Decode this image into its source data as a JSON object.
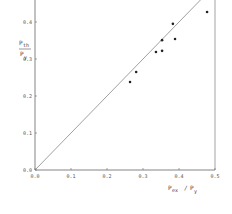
{
  "chart_data": {
    "type": "scatter",
    "title": "",
    "xlabel": "P_ex / P_y",
    "ylabel": "P_th / P_y",
    "xlim": [
      0.0,
      0.5
    ],
    "ylim": [
      0.0,
      0.46
    ],
    "x_ticks": [
      "0.0",
      "0.1",
      "0.2",
      "0.3",
      "0.4",
      "0.5"
    ],
    "y_ticks": [
      "0.0",
      "0.1",
      "0.2",
      "0.3",
      "0.4"
    ],
    "grid": false,
    "legend": null,
    "series": [
      {
        "name": "data",
        "marker": "dot",
        "points": [
          {
            "x": 0.264,
            "y": 0.238
          },
          {
            "x": 0.281,
            "y": 0.265
          },
          {
            "x": 0.336,
            "y": 0.319
          },
          {
            "x": 0.353,
            "y": 0.322
          },
          {
            "x": 0.353,
            "y": 0.351
          },
          {
            "x": 0.389,
            "y": 0.354
          },
          {
            "x": 0.383,
            "y": 0.395
          },
          {
            "x": 0.478,
            "y": 0.427
          }
        ]
      },
      {
        "name": "reference line y = x",
        "type": "line",
        "points": [
          {
            "x": 0.0,
            "y": 0.0
          },
          {
            "x": 0.46,
            "y": 0.46
          }
        ]
      }
    ],
    "colors": {
      "axis": "#666666",
      "points": "#222222",
      "line": "#777777"
    }
  },
  "labels": {
    "xlabel_main": "P",
    "xlabel_sub": "ex",
    "xlabel_div": "/",
    "xlabel_main2": "P",
    "xlabel_sub2": "y",
    "ylabel_main": "P",
    "ylabel_sub": "th",
    "ylabel_den": "P",
    "ylabel_den_sub": "y"
  }
}
